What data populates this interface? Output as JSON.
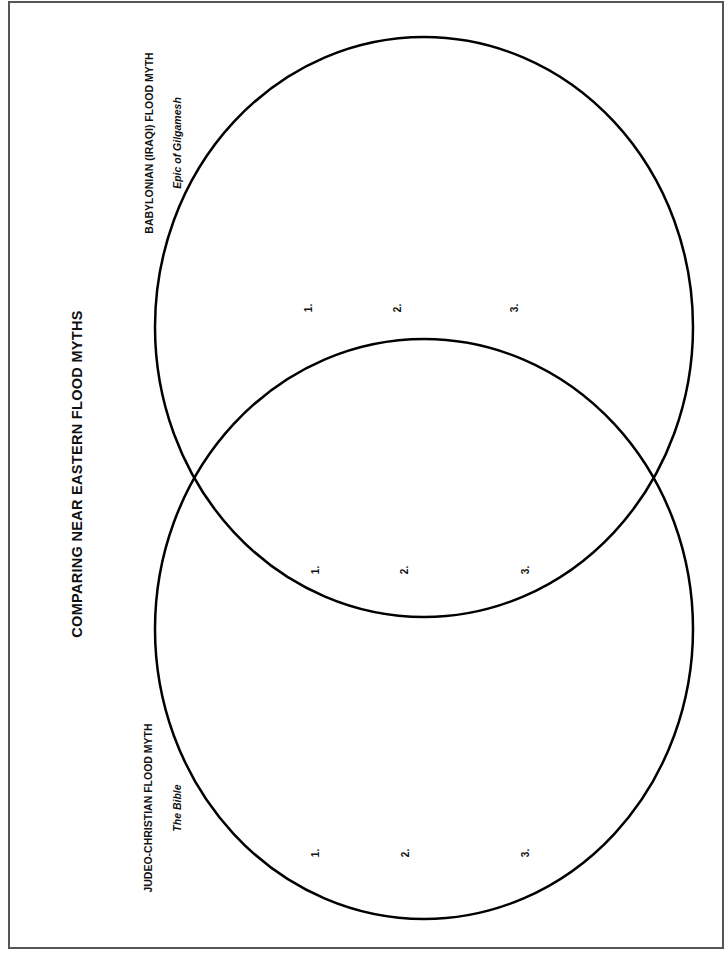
{
  "title": "COMPARING NEAR EASTERN FLOOD MYTHS",
  "colors": {
    "stroke": "#000000",
    "border": "#555555",
    "background": "#ffffff"
  },
  "circles": [
    {
      "id": "babylonian",
      "heading": "BABYLONIAN (IRAQI) FLOOD MYTH",
      "subheading": "Epic of Gilgamesh",
      "items": [
        "1.",
        "2.",
        "3."
      ]
    },
    {
      "id": "overlap",
      "heading": "",
      "subheading": "",
      "items": [
        "1.",
        "2.",
        "3."
      ]
    },
    {
      "id": "judeo-christian",
      "heading": "JUDEO-CHRISTIAN FLOOD MYTH",
      "subheading": "The Bible",
      "items": [
        "1.",
        "2.",
        "3."
      ]
    }
  ]
}
